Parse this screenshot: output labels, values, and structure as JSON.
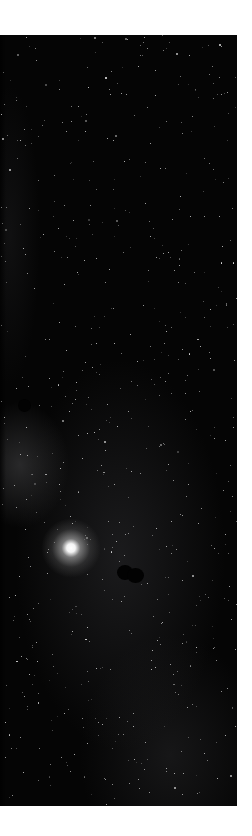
{
  "image": {
    "subject": "night sky starfield",
    "background_color": "#ffffff",
    "sky_color": "#050505",
    "bright_star": {
      "x": 71,
      "y": 548
    },
    "dark_objects": [
      {
        "x": 24,
        "y": 405,
        "w": 13,
        "h": 13
      },
      {
        "x": 130,
        "y": 572,
        "w": 26,
        "h": 16
      }
    ]
  }
}
